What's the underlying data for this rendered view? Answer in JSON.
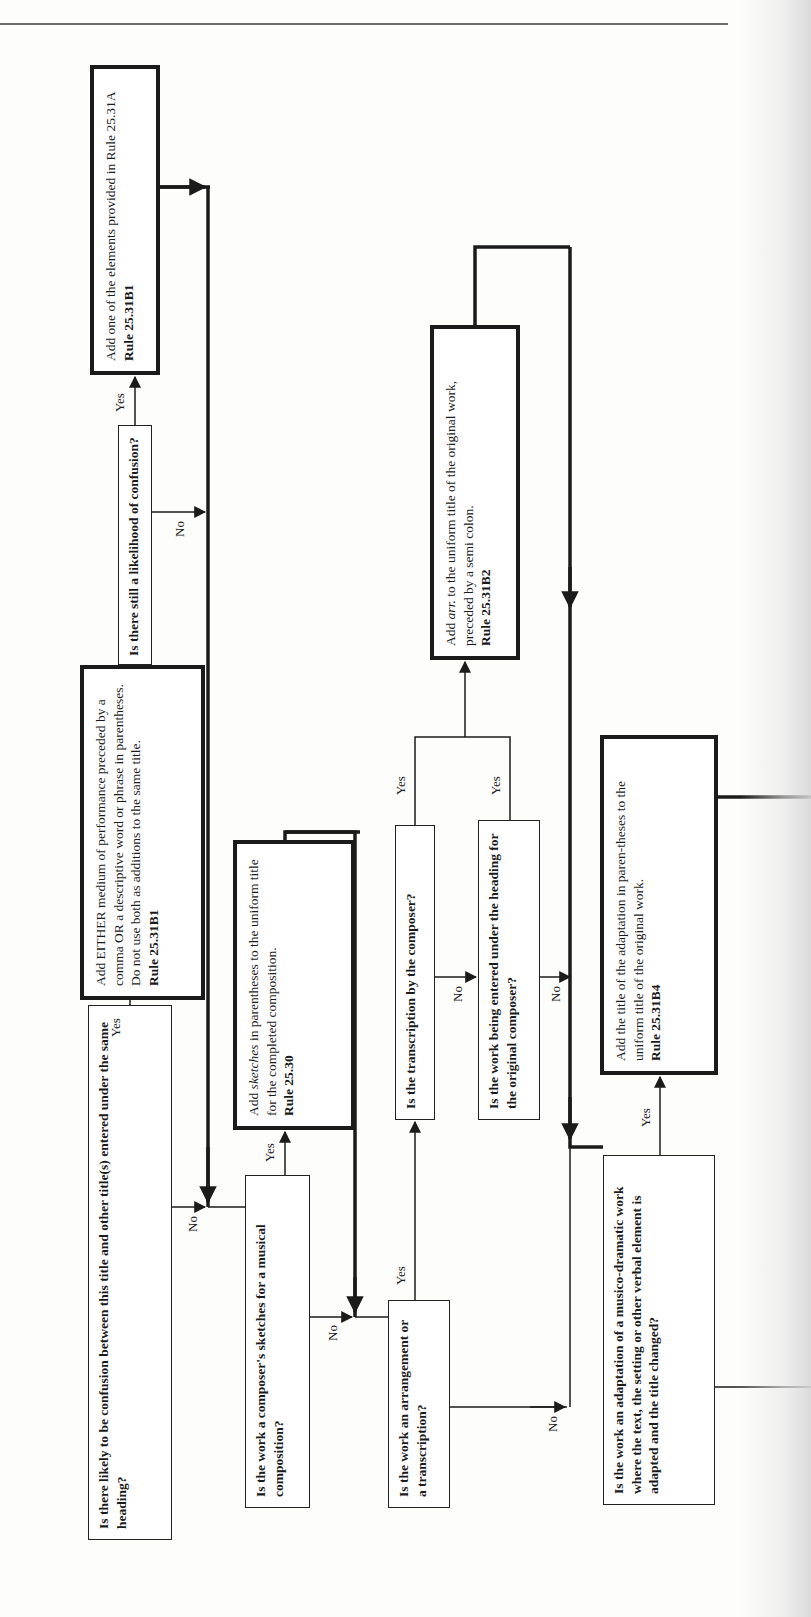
{
  "diagram": {
    "type": "flowchart",
    "orientation": "rotated-90-ccw",
    "questions": [
      {
        "id": "q1",
        "text": "Is there likely to be confusion between this title and other title(s) entered under the same heading?",
        "yes": "a1",
        "no": "q3"
      },
      {
        "id": "q2",
        "text": "Is there still a likelihood of confusion?",
        "yes": "a2",
        "no": "q3"
      },
      {
        "id": "q3",
        "text": "Is the work a composer's sketches for a musical composition?",
        "yes": "a3",
        "no": "q4"
      },
      {
        "id": "q4",
        "text": "Is the work an arrangement or a transcription?",
        "yes": "q5",
        "no": "q7"
      },
      {
        "id": "q5",
        "text": "Is the transcription by the composer?",
        "yes": "a4",
        "no": "q6"
      },
      {
        "id": "q6",
        "text": "Is the work being entered under the heading for the original composer?",
        "yes": "a4",
        "no": "q7"
      },
      {
        "id": "q7",
        "text": "Is the work an adaptation of a musico-dramatic work where the text, the setting or other verbal element is adapted and the title changed?",
        "yes": "a5",
        "no": "continues-off-page"
      }
    ],
    "actions": [
      {
        "id": "a1",
        "text": "Add EITHER medium of performance preceded by a comma OR a descriptive word or phrase in parentheses. Do not use both as additions to the same title.",
        "rule": "Rule 25.31B1",
        "next": "q2"
      },
      {
        "id": "a2",
        "text": "Add one of the elements provided in Rule 25.31A",
        "rule": "Rule 25.31B1",
        "next": "q3"
      },
      {
        "id": "a3",
        "text_before": "Add ",
        "text_italic": "sketches",
        "text_after": " in parentheses to the uniform title for the completed composition.",
        "rule": "Rule 25.30",
        "next": "q4"
      },
      {
        "id": "a4",
        "text_before": "Add ",
        "text_italic": "arr.",
        "text_after": " to the uniform title of the original work, preceded by a semi colon.",
        "rule": "Rule 25.31B2",
        "next": "q7"
      },
      {
        "id": "a5",
        "text": "Add the title of the adaptation in paren-theses to the uniform title of the original work.",
        "rule": "Rule 25.31B4",
        "next": "continues-off-page"
      }
    ],
    "labels": {
      "yes": "Yes",
      "no": "No"
    },
    "colors": {
      "line": "#1b1b1b",
      "background": "#fdfdfc",
      "rule_line": "#6d6d6d"
    }
  }
}
